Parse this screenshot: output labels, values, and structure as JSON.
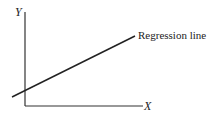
{
  "diagram": {
    "y_axis_label": "Y",
    "x_axis_label": "X",
    "line_label": "Regression line",
    "colors": {
      "ink": "#222222",
      "background": "#ffffff"
    }
  }
}
